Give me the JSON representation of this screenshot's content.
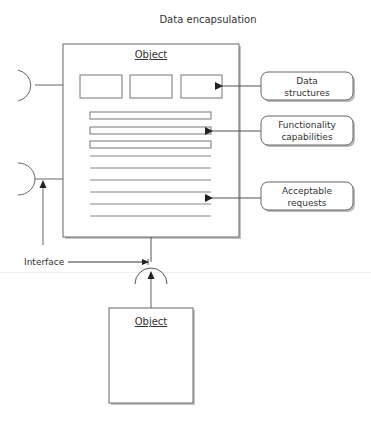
{
  "title": "Data encapsulation",
  "main_object": {
    "label": "Object",
    "data_slots": 3,
    "function_bars": 3,
    "request_lines": 6
  },
  "callouts": [
    {
      "line1": "Data",
      "line2": "structures"
    },
    {
      "line1": "Functionality",
      "line2": "capabilities"
    },
    {
      "line1": "Acceptable",
      "line2": "requests"
    }
  ],
  "interface_label": "Interface",
  "client_object": {
    "label": "Object"
  },
  "colors": {
    "stroke": "#555555",
    "shadow": "#b8b8b8",
    "text": "#333333"
  }
}
